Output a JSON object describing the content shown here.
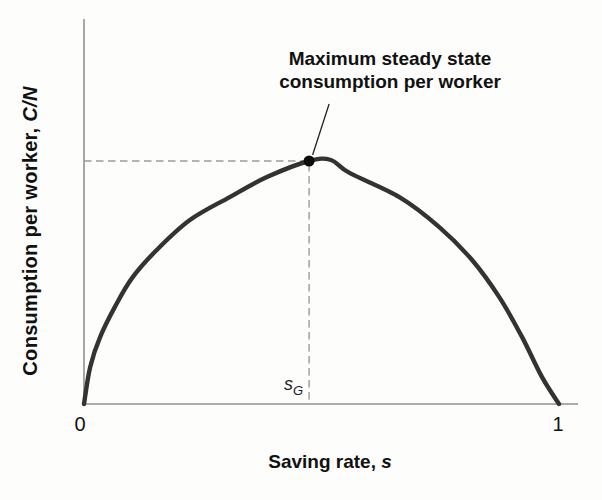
{
  "figure": {
    "ylabel_text": "Consumption per worker, ",
    "ylabel_var": "C/N",
    "xlabel_text": "Saving rate, ",
    "xlabel_var": "s",
    "tick_zero": "0",
    "tick_one": "1",
    "golden_label_main": "s",
    "golden_label_sub": "G",
    "annotation_line1": "Maximum steady state",
    "annotation_line2": "consumption per worker"
  },
  "colors": {
    "curve": "#333333",
    "axis": "#919191",
    "dashed": "#9a9a9a",
    "dot": "#0d0d0d",
    "leader": "#222222",
    "text": "#111111"
  },
  "chart_data": {
    "type": "line",
    "title": "",
    "xlabel": "Saving rate, s",
    "ylabel": "Consumption per worker, C/N",
    "x_ticks": [
      "0",
      "1"
    ],
    "xlim": [
      0,
      1
    ],
    "ylim": [
      0,
      1.1
    ],
    "grid": false,
    "legend": false,
    "series": [
      {
        "name": "steady-state-consumption-per-worker",
        "x": [
          0,
          0.013,
          0.034,
          0.065,
          0.101,
          0.153,
          0.223,
          0.307,
          0.385,
          0.474,
          0.52,
          0.559,
          0.664,
          0.748,
          0.817,
          0.874,
          0.922,
          0.964,
          1.0
        ],
        "y": [
          0,
          0.152,
          0.275,
          0.398,
          0.516,
          0.631,
          0.754,
          0.848,
          0.93,
          0.996,
          1.0,
          0.947,
          0.848,
          0.725,
          0.59,
          0.439,
          0.275,
          0.111,
          0.0
        ]
      }
    ],
    "golden_rule": {
      "s": 0.474,
      "c": 0.996,
      "label": "s_G"
    },
    "annotations": [
      {
        "text": "Maximum steady state consumption per worker",
        "target_x": 0.474,
        "target_y": 0.996
      }
    ]
  }
}
